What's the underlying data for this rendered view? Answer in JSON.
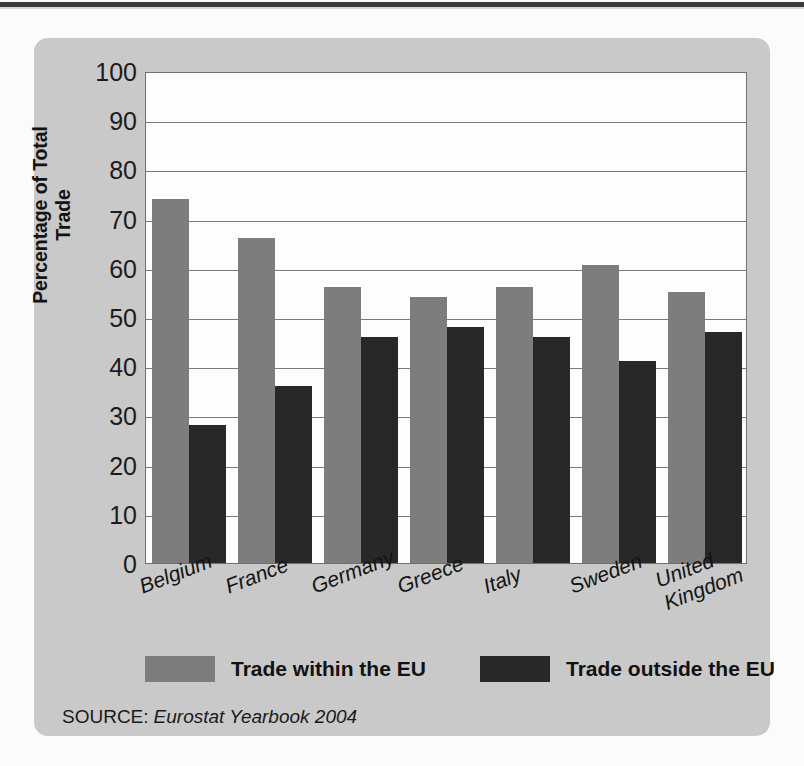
{
  "chart_data": {
    "type": "bar",
    "title": "",
    "xlabel": "",
    "ylabel": "Percentage of Total Trade",
    "ylim": [
      0,
      100
    ],
    "ytick_step": 10,
    "yticks": [
      "100",
      "90",
      "80",
      "70",
      "60",
      "50",
      "40",
      "30",
      "20",
      "10",
      "0"
    ],
    "grid": true,
    "legend_position": "bottom",
    "categories": [
      "Belgium",
      "France",
      "Germany",
      "Greece",
      "Italy",
      "Sweden",
      "United\nKingdom"
    ],
    "series": [
      {
        "name": "Trade within the EU",
        "color": "#7d7d7d",
        "values": [
          74,
          66,
          56,
          54,
          56,
          60.5,
          55
        ]
      },
      {
        "name": "Trade outside the EU",
        "color": "#282828",
        "values": [
          28,
          36,
          46,
          48,
          46,
          41,
          47
        ]
      }
    ],
    "source_label": "SOURCE:",
    "source_text": "Eurostat Yearbook 2004"
  },
  "colors": {
    "panel": "#c9c9c9",
    "page": "#fbfbfb",
    "plot_background": "#fdfdfd",
    "axis": "#6f6f6f",
    "gridline": "#7a7a7a",
    "within_eu": "#7d7d7d",
    "outside_eu": "#282828",
    "text": "#131313"
  },
  "legend": {
    "items": [
      {
        "label": "Trade within the EU",
        "swatch": "within"
      },
      {
        "label": "Trade outside the EU",
        "swatch": "outside"
      }
    ]
  }
}
